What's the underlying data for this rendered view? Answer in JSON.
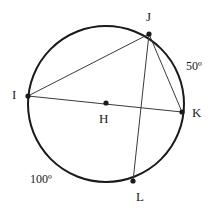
{
  "figure": {
    "type": "circle-geometry-diagram",
    "width": 221,
    "height": 216,
    "background_color": "#ffffff",
    "stroke_color": "#1a1a1a",
    "chord_color": "#3a3a3a",
    "circle": {
      "center_label": "H",
      "cx": 106,
      "cy": 104,
      "r": 78,
      "stroke_width": 2
    },
    "points": [
      {
        "label": "I",
        "x": 28,
        "y": 96,
        "label_x": 12,
        "label_y": 88
      },
      {
        "label": "J",
        "x": 149,
        "y": 34,
        "label_x": 146,
        "label_y": 10
      },
      {
        "label": "K",
        "x": 182,
        "y": 112,
        "label_x": 192,
        "label_y": 106
      },
      {
        "label": "L",
        "x": 133,
        "y": 181,
        "label_x": 136,
        "label_y": 190
      },
      {
        "label": "H",
        "x": 106,
        "y": 103,
        "label_x": 99,
        "label_y": 112
      }
    ],
    "chords": [
      {
        "name": "chord-i-j",
        "from": "I",
        "to": "J",
        "x1": 28,
        "y1": 96,
        "x2": 149,
        "y2": 34
      },
      {
        "name": "chord-i-k",
        "from": "I",
        "to": "K",
        "x1": 28,
        "y1": 96,
        "x2": 182,
        "y2": 112
      },
      {
        "name": "chord-j-k",
        "from": "J",
        "to": "K",
        "x1": 149,
        "y1": 34,
        "x2": 182,
        "y2": 112
      },
      {
        "name": "chord-j-l",
        "from": "J",
        "to": "L",
        "x1": 149,
        "y1": 34,
        "x2": 133,
        "y2": 181
      }
    ],
    "arc_labels": [
      {
        "name": "arc-label-jk",
        "text": "50º",
        "x": 186,
        "y": 60,
        "arc": "JK"
      },
      {
        "name": "arc-label-il",
        "text": "100º",
        "x": 30,
        "y": 173,
        "arc": "IL"
      }
    ]
  }
}
